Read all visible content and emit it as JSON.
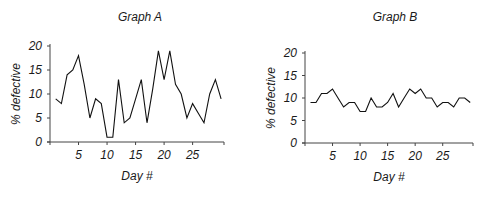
{
  "chart_data": [
    {
      "type": "line",
      "title": "Graph A",
      "xlabel": "Day #",
      "ylabel": "% defective",
      "x": [
        1,
        2,
        3,
        4,
        5,
        6,
        7,
        8,
        9,
        10,
        11,
        12,
        13,
        14,
        15,
        16,
        17,
        18,
        19,
        20,
        21,
        22,
        23,
        24,
        25,
        26,
        27,
        28,
        29,
        30
      ],
      "values": [
        9,
        8,
        14,
        15,
        18,
        12,
        5,
        9,
        8,
        1,
        1,
        13,
        4,
        5,
        9,
        13,
        4,
        11,
        19,
        13,
        19,
        12,
        10,
        5,
        8,
        6,
        4,
        10,
        13,
        9
      ],
      "xticks": [
        5,
        10,
        15,
        20,
        25
      ],
      "yticks": [
        0,
        5,
        10,
        15,
        20
      ],
      "xlim": [
        0,
        30.5
      ],
      "ylim": [
        0,
        20
      ],
      "grid": false,
      "line_color": "#111111"
    },
    {
      "type": "line",
      "title": "Graph B",
      "xlabel": "Day #",
      "ylabel": "% defective",
      "x": [
        1,
        2,
        3,
        4,
        5,
        6,
        7,
        8,
        9,
        10,
        11,
        12,
        13,
        14,
        15,
        16,
        17,
        18,
        19,
        20,
        21,
        22,
        23,
        24,
        25,
        26,
        27,
        28,
        29,
        30
      ],
      "values": [
        9,
        9,
        11,
        11,
        12,
        10,
        8,
        9,
        9,
        7,
        7,
        10,
        8,
        8,
        9,
        11,
        8,
        10,
        12,
        11,
        12,
        10,
        10,
        8,
        9,
        9,
        8,
        10,
        10,
        9
      ],
      "xticks": [
        5,
        10,
        15,
        20,
        25
      ],
      "yticks": [
        0,
        5,
        10,
        15,
        20
      ],
      "xlim": [
        0,
        30.5
      ],
      "ylim": [
        0,
        20
      ],
      "grid": false,
      "line_color": "#111111"
    }
  ]
}
